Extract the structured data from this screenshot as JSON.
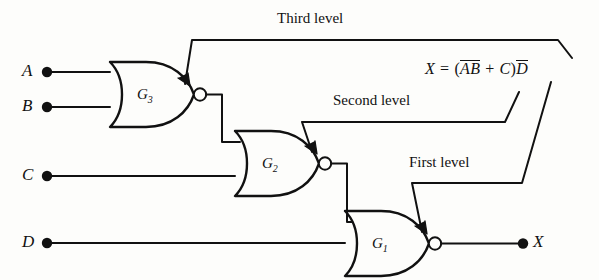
{
  "figure": {
    "type": "logic-circuit-diagram"
  },
  "inputs": [
    {
      "id": "A",
      "label": "A",
      "x": 30,
      "y": 72
    },
    {
      "id": "B",
      "label": "B",
      "x": 30,
      "y": 107
    },
    {
      "id": "C",
      "label": "C",
      "x": 30,
      "y": 176
    },
    {
      "id": "D",
      "label": "D",
      "x": 30,
      "y": 243
    }
  ],
  "output": {
    "id": "X",
    "label": "X",
    "x": 533,
    "y": 230
  },
  "gates": [
    {
      "id": "G3",
      "label": "G",
      "subscript": "3",
      "type": "NOR",
      "level": "Third level"
    },
    {
      "id": "G2",
      "label": "G",
      "subscript": "2",
      "type": "NOR",
      "level": "Second level"
    },
    {
      "id": "G1",
      "label": "G",
      "subscript": "1",
      "type": "NOR",
      "level": "First level"
    }
  ],
  "annotations": [
    {
      "id": "third-level",
      "text": "Third level"
    },
    {
      "id": "second-level",
      "text": "Second level"
    },
    {
      "id": "first-level",
      "text": "First level"
    }
  ],
  "equation": {
    "output": "X",
    "equals": "=",
    "open_paren": "(",
    "term_a": "A",
    "term_b": "B",
    "plus": "+",
    "term_c": "C",
    "close_paren": ")",
    "term_d": "D",
    "plain_text": "X = (A̅B̅ + C)D̅"
  },
  "colors": {
    "stroke": "#111111",
    "background": "#fdfdfb",
    "text": "#111111"
  }
}
